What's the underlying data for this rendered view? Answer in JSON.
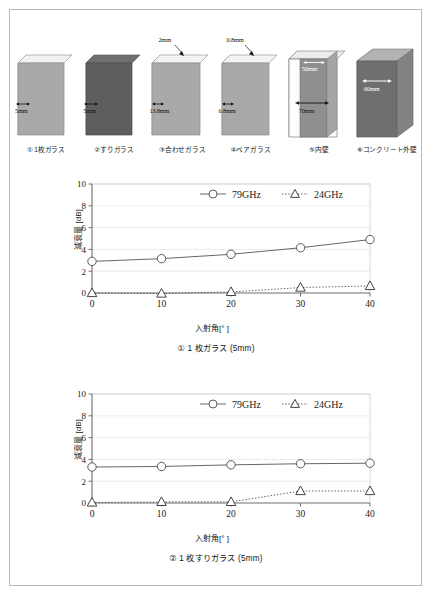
{
  "figure": {
    "specimens": [
      {
        "id": "spec-1",
        "label": "① 1枚ガラス",
        "dims": [
          "5mm"
        ],
        "style": "single-light",
        "thickness_mm": 5
      },
      {
        "id": "spec-2",
        "label": "②すりガラス",
        "dims": [
          "5mm"
        ],
        "style": "single-dark",
        "thickness_mm": 5
      },
      {
        "id": "spec-3",
        "label": "③合わせガラス",
        "dims": [
          "2mm",
          "13.8mm"
        ],
        "style": "laminated",
        "thickness_mm": 13.8
      },
      {
        "id": "spec-4",
        "label": "④ペアガラス",
        "dims": [
          "0.8mm",
          "6.8mm"
        ],
        "style": "pair",
        "thickness_mm": 6.8
      },
      {
        "id": "spec-5",
        "label": "⑤内壁",
        "dims": [
          "50mm",
          "70mm"
        ],
        "style": "inner-wall",
        "thickness_mm": 70
      },
      {
        "id": "spec-6",
        "label": "⑥コンクリート外壁",
        "dims": [
          "60mm"
        ],
        "style": "concrete",
        "thickness_mm": 60
      }
    ]
  },
  "chart_data": [
    {
      "id": "chart-1",
      "type": "line",
      "title": "① 1 枚ガラス (5mm)",
      "xlabel": "入射角[° ]",
      "ylabel": "減衰量 [dB]",
      "x": [
        0,
        10,
        20,
        30,
        40
      ],
      "xticks": [
        "0",
        "10",
        "20",
        "30",
        "40"
      ],
      "yticks": [
        "0",
        "2",
        "4",
        "6",
        "8",
        "10"
      ],
      "xlim": [
        0,
        40
      ],
      "ylim": [
        0,
        10
      ],
      "grid": true,
      "legend_position": "top-center",
      "series": [
        {
          "name": "79GHz",
          "marker": "circle",
          "line": "solid",
          "color": "#555555",
          "values": [
            2.9,
            3.15,
            3.55,
            4.15,
            4.9
          ]
        },
        {
          "name": "24GHz",
          "marker": "triangle",
          "line": "dotted",
          "color": "#333333",
          "values": [
            0.0,
            -0.05,
            0.1,
            0.5,
            0.65
          ]
        }
      ]
    },
    {
      "id": "chart-2",
      "type": "line",
      "title": "② 1 枚すりガラス (5mm)",
      "xlabel": "入射角[° ]",
      "ylabel": "減衰量 [dB]",
      "x": [
        0,
        10,
        20,
        30,
        40
      ],
      "xticks": [
        "0",
        "10",
        "20",
        "30",
        "40"
      ],
      "yticks": [
        "0",
        "2",
        "4",
        "6",
        "8",
        "10"
      ],
      "xlim": [
        0,
        40
      ],
      "ylim": [
        0,
        10
      ],
      "grid": true,
      "legend_position": "top-center",
      "series": [
        {
          "name": "79GHz",
          "marker": "circle",
          "line": "solid",
          "color": "#555555",
          "values": [
            3.3,
            3.35,
            3.5,
            3.6,
            3.65
          ]
        },
        {
          "name": "24GHz",
          "marker": "triangle",
          "line": "dotted",
          "color": "#333333",
          "values": [
            0.05,
            0.1,
            0.1,
            1.1,
            1.1
          ]
        }
      ]
    }
  ]
}
